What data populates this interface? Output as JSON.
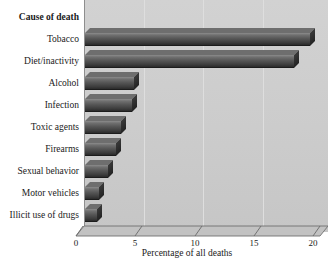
{
  "chart_data": {
    "type": "bar",
    "orientation": "horizontal",
    "title": "",
    "category_axis_header": "Cause of death",
    "categories": [
      "Tobacco",
      "Diet/inactivity",
      "Alcohol",
      "Infection",
      "Toxic agents",
      "Firearms",
      "Sexual behavior",
      "Motor vehicles",
      "Illicit use of drugs"
    ],
    "values": [
      19.0,
      17.6,
      4.1,
      4.0,
      3.0,
      2.6,
      1.9,
      1.2,
      1.0
    ],
    "xlabel": "Percentage of all deaths",
    "ylabel": "Cause of death",
    "xlim": [
      0,
      20
    ],
    "xticks": [
      0,
      5,
      10,
      15,
      20
    ],
    "xtick_labels": [
      "0",
      "5",
      "10",
      "15",
      "20"
    ],
    "grid": "vertical-light",
    "legend": "none",
    "style_3d": true
  },
  "colors": {
    "plot_background": "#cccccc",
    "page_background": "#ffffff",
    "bar_light": "#8c8c8c",
    "bar_dark": "#2b2b2b",
    "bar_cap": "#232323",
    "gridline": "#dedede",
    "axis_line": "#8e8e8e",
    "text": "#1a1a1a"
  }
}
